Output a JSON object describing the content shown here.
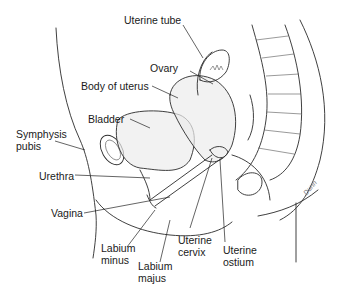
{
  "diagram": {
    "labels": {
      "uterine_tube": "Uterine tube",
      "ovary": "Ovary",
      "body_of_uterus": "Body of uterus",
      "bladder": "Bladder",
      "symphysis_pubis": "Symphysis\npubis",
      "urethra": "Urethra",
      "vagina": "Vagina",
      "labium_minus": "Labium\nminus",
      "labium_majus": "Labium\nmajus",
      "uterine_cervix": "Uterine\ncervix",
      "uterine_ostium": "Uterine\nostium"
    },
    "signature": "Dunn"
  }
}
